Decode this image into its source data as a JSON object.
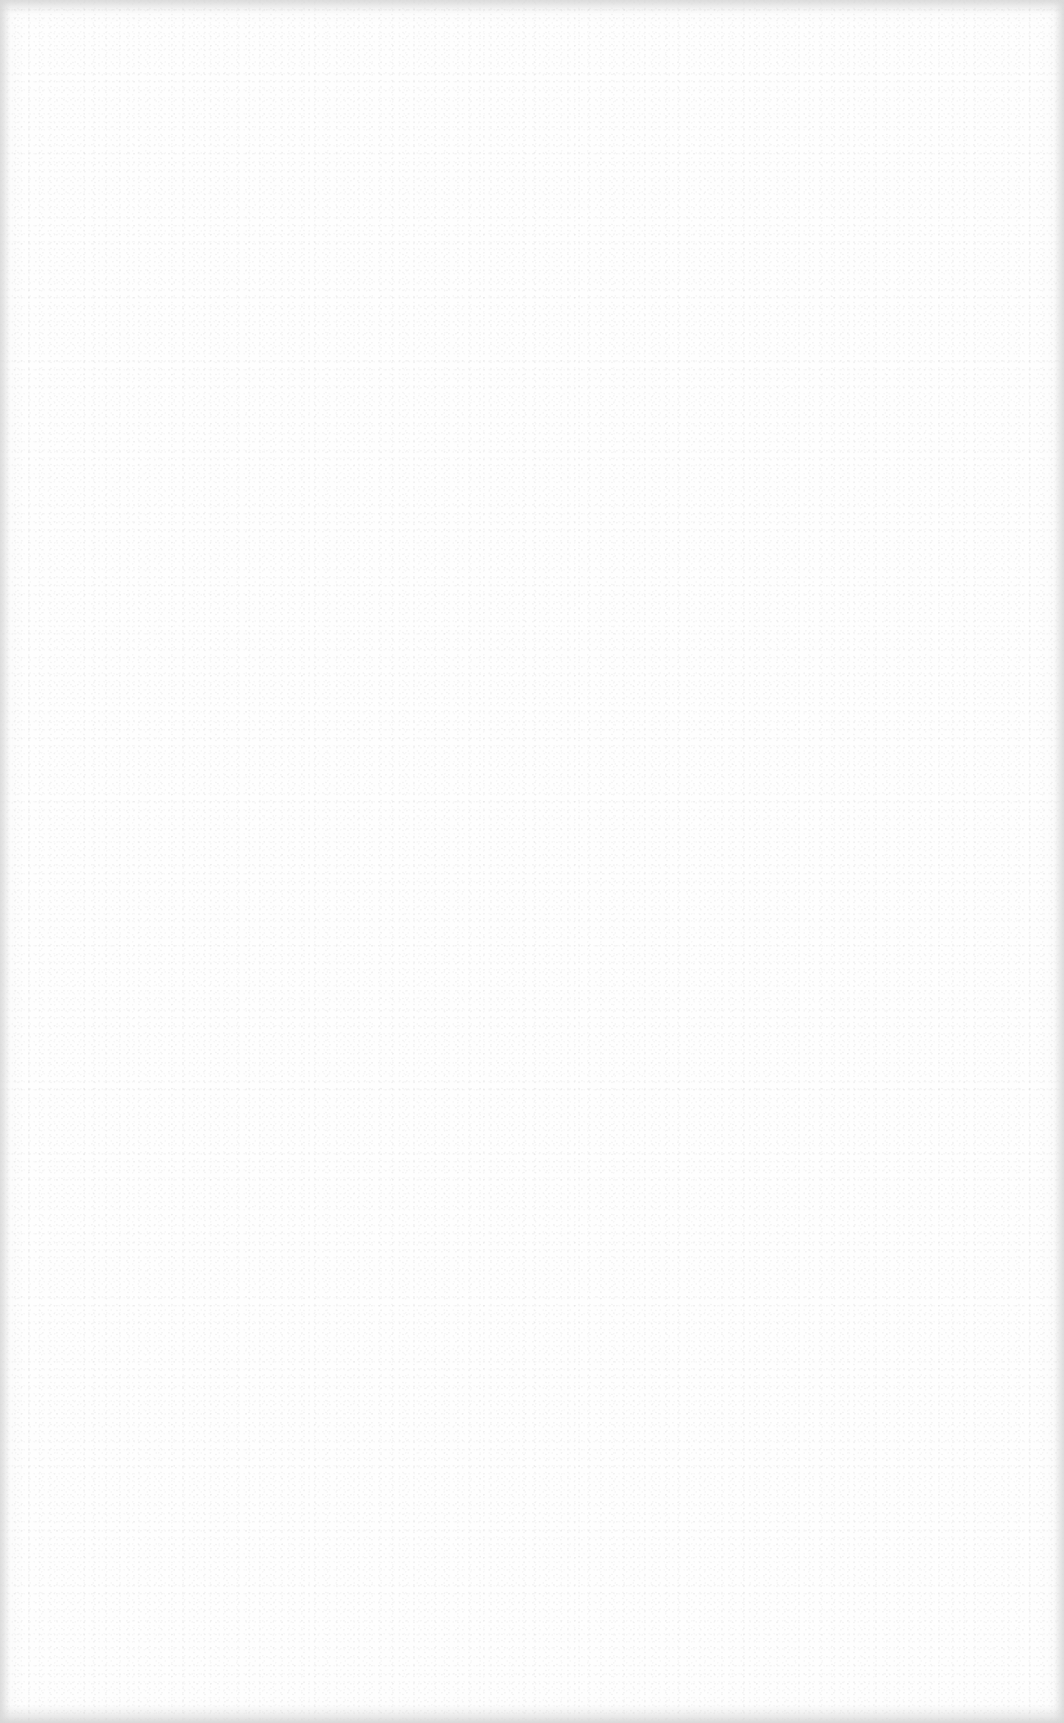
{
  "page": {
    "background_color": "#fefefe",
    "content": []
  }
}
